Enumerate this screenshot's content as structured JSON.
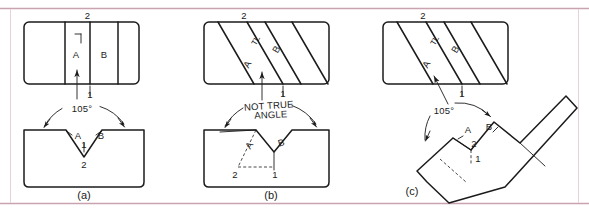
{
  "page": {
    "background_color": "#ffffff",
    "rule_color": "#c9a3b0",
    "line_color": "#1b1b1b",
    "width": 589,
    "height": 213
  },
  "figures": [
    {
      "id": "a",
      "caption": "(a)",
      "top_view": {
        "point_labels": [
          "2",
          "1"
        ],
        "face_labels": [
          "A",
          "B"
        ],
        "fold_label": "TL"
      },
      "front_view": {
        "dimension_text": "105°",
        "face_labels": [
          "A",
          "B"
        ],
        "point_labels": [
          "1",
          "2"
        ]
      }
    },
    {
      "id": "b",
      "caption": "(b)",
      "top_view": {
        "point_labels": [
          "2",
          "1"
        ],
        "face_labels": [
          "A",
          "B"
        ],
        "fold_label": "TL"
      },
      "front_view": {
        "dimension_text_line1": "NOT TRUE",
        "dimension_text_line2": "ANGLE",
        "face_labels": [
          "A",
          "B"
        ],
        "point_labels": [
          "2",
          "1"
        ]
      }
    },
    {
      "id": "c",
      "caption": "(c)",
      "top_view": {
        "point_labels": [
          "2",
          "1"
        ],
        "face_labels": [
          "A",
          "B"
        ],
        "fold_label": "TL"
      },
      "front_view": {
        "dimension_text": "105°",
        "face_labels": [
          "A",
          "B"
        ],
        "point_labels": [
          "2",
          "1"
        ]
      }
    }
  ],
  "labels": {
    "angle_105": "105°",
    "not_true": "NOT TRUE",
    "angle_word": "ANGLE",
    "tl": "TL",
    "A": "A",
    "B": "B",
    "one": "1",
    "two": "2",
    "cap_a": "(a)",
    "cap_b": "(b)",
    "cap_c": "(c)"
  }
}
